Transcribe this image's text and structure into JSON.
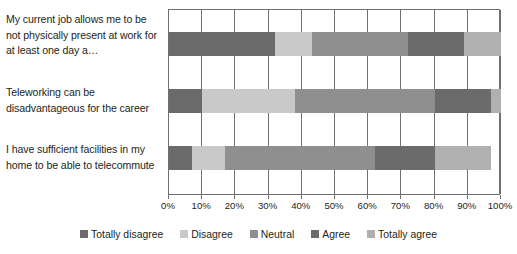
{
  "chart_data": {
    "type": "bar",
    "orientation": "horizontal",
    "stacked": true,
    "stack_mode": "percent",
    "title": "",
    "xlabel": "",
    "ylabel": "",
    "xlim": [
      0,
      100
    ],
    "grid": true,
    "legend_position": "bottom",
    "categories": [
      "My current job allows me to be not physically present at work for at least one day a…",
      "Teleworking can be disadvantageous for the career",
      "I have sufficient facilities in my home to be able to telecommute"
    ],
    "tick_labels": [
      "0%",
      "10%",
      "20%",
      "30%",
      "40%",
      "50%",
      "60%",
      "70%",
      "80%",
      "90%",
      "100%"
    ],
    "tick_values": [
      0,
      10,
      20,
      30,
      40,
      50,
      60,
      70,
      80,
      90,
      100
    ],
    "series": [
      {
        "name": "Totally disagree",
        "color": "#6b6b6b",
        "values": [
          32,
          10,
          7
        ]
      },
      {
        "name": "Disagree",
        "color": "#c9c9c9",
        "values": [
          11,
          28,
          10
        ]
      },
      {
        "name": "Neutral",
        "color": "#8f8f8f",
        "values": [
          29,
          42,
          45
        ]
      },
      {
        "name": "Agree",
        "color": "#6b6b6b",
        "values": [
          17,
          17,
          18
        ]
      },
      {
        "name": "Totally agree",
        "color": "#b0b0b0",
        "values": [
          11,
          3,
          17
        ]
      }
    ]
  },
  "colors": {
    "axis": "#6f6f6f",
    "text": "#231f20",
    "background": "#ffffff"
  }
}
